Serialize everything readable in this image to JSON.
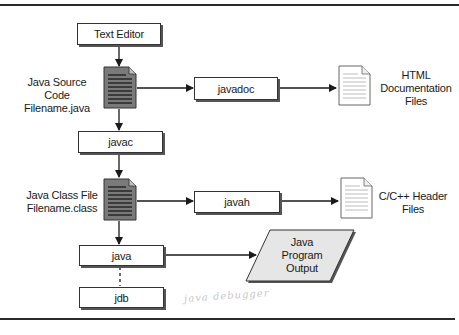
{
  "diagram": {
    "nodes": {
      "text_editor": "Text Editor",
      "javadoc": "javadoc",
      "javac": "javac",
      "javah": "javah",
      "java": "java",
      "jdb": "jdb"
    },
    "files": {
      "source_code": {
        "line1": "Java Source Code",
        "line2": "Filename.java"
      },
      "class_file": {
        "line1": "Java Class File",
        "line2": "Filename.class"
      },
      "html_docs": {
        "line1": "HTML",
        "line2": "Documentation",
        "line3": "Files"
      },
      "c_headers": {
        "line1": "C/C++ Header",
        "line2": "Files"
      }
    },
    "output": {
      "line1": "Java",
      "line2": "Program",
      "line3": "Output"
    },
    "annotation": "java debugger",
    "edges": [
      {
        "from": "Text Editor",
        "to": "Java Source Code",
        "style": "solid"
      },
      {
        "from": "Java Source Code",
        "to": "javadoc",
        "style": "solid"
      },
      {
        "from": "javadoc",
        "to": "HTML Documentation Files",
        "style": "solid"
      },
      {
        "from": "Java Source Code",
        "to": "javac",
        "style": "solid"
      },
      {
        "from": "javac",
        "to": "Java Class File",
        "style": "solid"
      },
      {
        "from": "Java Class File",
        "to": "javah",
        "style": "solid"
      },
      {
        "from": "javah",
        "to": "C/C++ Header Files",
        "style": "solid"
      },
      {
        "from": "Java Class File",
        "to": "java",
        "style": "solid"
      },
      {
        "from": "java",
        "to": "Java Program Output",
        "style": "solid"
      },
      {
        "from": "java",
        "to": "jdb",
        "style": "dashed"
      }
    ],
    "colors": {
      "dark_doc_fill": "#7a7a7a",
      "light_doc_fill": "#ffffff",
      "output_fill": "#e6e6e6",
      "line": "#1a1a1a"
    }
  }
}
